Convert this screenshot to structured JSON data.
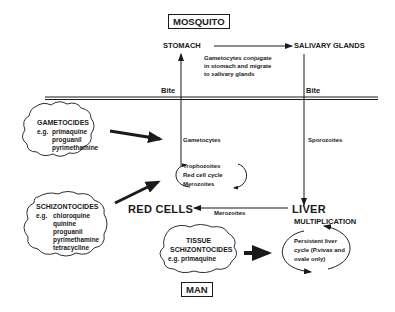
{
  "headers": {
    "mosquito": "MOSQUITO",
    "man": "MAN"
  },
  "mosquito": {
    "stomach": "STOMACH",
    "salivary_glands": "SALIVARY GLANDS",
    "note_lines": [
      "Gametocytes conjugate",
      "in stomach and migrate",
      "to salivary glands"
    ]
  },
  "bite_labels": [
    "Bite",
    "Bite"
  ],
  "man": {
    "gametocytes": "Gametocytes",
    "sporozoites": "Sporozoites",
    "red_cell_cycle": [
      "Trophozoites",
      "Red cell cycle",
      "Merozoites"
    ],
    "red_cells": "RED CELLS",
    "merozoites": "Merozoites",
    "liver": "LIVER",
    "multiplication": "MULTIPLICATION",
    "persistent_cycle": [
      "Persistent liver",
      "cycle (P.vivax and",
      "ovale only)"
    ]
  },
  "drug_groups": {
    "gametocides": {
      "title": "GAMETOCIDES",
      "prefix": "e.g.",
      "drugs": [
        "primaquine",
        "proguanil",
        "pyrimethamine"
      ]
    },
    "schizontocides": {
      "title": "SCHIZONTOCIDES",
      "prefix": "e.g.",
      "drugs": [
        "chloroquine",
        "quinine",
        "proguanil",
        "pyrimethamine",
        "tetracycline"
      ]
    },
    "tissue_schizontocides": {
      "title_lines": [
        "TISSUE",
        "SCHIZONTOCIDES"
      ],
      "example": "e.g. primaquine"
    }
  }
}
